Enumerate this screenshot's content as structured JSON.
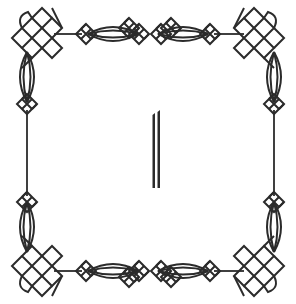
{
  "image": {
    "description": "Decorative ornamental Celtic-knot square frame with a double vertical bar glyph in the center",
    "center_glyph": "||",
    "colors": {
      "background": "#ffffff",
      "ink": "#2b2b2b"
    }
  }
}
